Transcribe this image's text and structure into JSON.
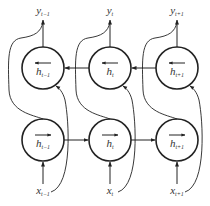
{
  "diagram": {
    "columns": [
      {
        "x": 43,
        "y_label": "y",
        "y_sub": "t−1",
        "x_label": "x",
        "x_sub": "t−1",
        "h_label": "h",
        "h_sub": "t−1"
      },
      {
        "x": 110,
        "y_label": "y",
        "y_sub": "t",
        "x_label": "x",
        "x_sub": "t",
        "h_label": "h",
        "h_sub": "t"
      },
      {
        "x": 177,
        "y_label": "y",
        "y_sub": "t+1",
        "x_label": "x",
        "x_sub": "t+1",
        "h_label": "h",
        "h_sub": "t+1"
      }
    ],
    "layers": {
      "backward": {
        "y": 68,
        "direction": "left"
      },
      "forward": {
        "y": 140,
        "direction": "right"
      }
    },
    "node_radius": 21,
    "colors": {
      "stroke": "#222222",
      "text": "#333333",
      "background": "#ffffff"
    }
  }
}
